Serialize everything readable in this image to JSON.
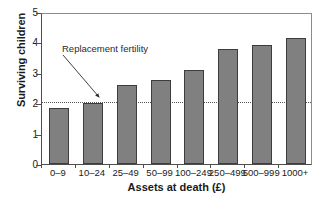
{
  "chart_data": {
    "type": "bar",
    "title": "",
    "xlabel": "Assets at death (£)",
    "ylabel": "Surviving children",
    "categories": [
      "0–9",
      "10–24",
      "25–49",
      "50–99",
      "100–249",
      "250–499",
      "500–999",
      "1000+"
    ],
    "values": [
      1.85,
      2.0,
      2.6,
      2.75,
      3.1,
      3.78,
      3.9,
      4.13
    ],
    "ylim": [
      0,
      5
    ],
    "yticks": [
      0,
      1,
      2,
      3,
      4,
      5
    ],
    "ytick_labels": [
      "0",
      "1",
      "2",
      "3",
      "4",
      "5"
    ],
    "grid": false,
    "legend": "none",
    "annotations": [
      {
        "label": "Replacement fertility",
        "value": 2.1,
        "line_style": "dotted",
        "arrow_target_category": "10–24"
      }
    ],
    "colors": {
      "bar_fill": "#808080",
      "bar_edge": "#3d3d3d",
      "axis": "#4d4d4d",
      "reference_line": "#555555",
      "text": "#1a1a1a",
      "background": "#ffffff"
    }
  }
}
